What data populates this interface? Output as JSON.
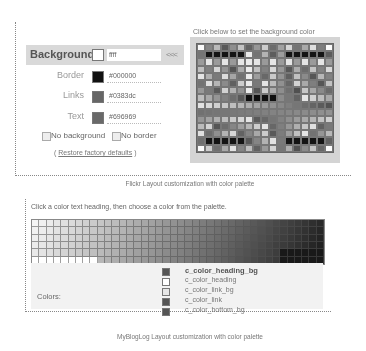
{
  "flickr": {
    "palette_instruction": "Click below to set the background color",
    "rows": [
      {
        "label": "Background",
        "value": "ffff",
        "swatch": "#ffffff"
      },
      {
        "label": "Border",
        "value": "#000000",
        "swatch": "#111111"
      },
      {
        "label": "Links",
        "value": "#0383dc",
        "swatch": "#666666"
      },
      {
        "label": "Text",
        "value": "#696969",
        "swatch": "#696969"
      }
    ],
    "apply_arrow": "<<<",
    "no_background_label": "No background",
    "no_border_label": "No border",
    "restore_prefix": "( ",
    "restore_link": "Restore factory defaults",
    "restore_suffix": " )",
    "caption": "Flickr Layout customization with color palette"
  },
  "mybloglog": {
    "instruction": "Click a color text heading, then choose a color from the palette.",
    "colors_label": "Colors:",
    "color_items": [
      {
        "name": "c_color_heading_bg",
        "swatch": "#555555",
        "selected": true
      },
      {
        "name": "c_color_heading",
        "swatch": "#ffffff",
        "selected": false
      },
      {
        "name": "c_color_link_bg",
        "swatch": "#e6e6e6",
        "selected": false
      },
      {
        "name": "c_color_link",
        "swatch": "#555555",
        "selected": false
      },
      {
        "name": "c_color_bottom_bg",
        "swatch": "#555555",
        "selected": false
      }
    ],
    "caption": "MyBlogLog Layout customization with color palette"
  }
}
